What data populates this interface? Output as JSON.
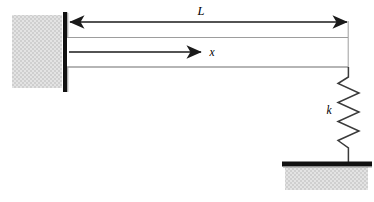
{
  "figure": {
    "type": "engineering-schematic",
    "background_color": "#ffffff",
    "line_color": "#1a1a1a",
    "beam_edge_color": "#999999",
    "hatch_fill_color": "#e0e0e0",
    "hatch_dot_color": "#c9c9c9",
    "support_color": "#111111"
  },
  "labels": {
    "length": "L",
    "axis": "x",
    "stiffness": "k"
  },
  "geometry": {
    "left_wall": {
      "x": 12,
      "y": 15,
      "width": 50,
      "height": 73
    },
    "fixed_support_bar": {
      "x": 63,
      "y": 12,
      "width": 4,
      "height": 80
    },
    "beam": {
      "x1": 67,
      "y1": 37,
      "x2": 348,
      "y2": 67
    },
    "dimension_line": {
      "x1": 69,
      "x2": 347,
      "y": 22
    },
    "axis_arrow": {
      "x1": 69,
      "x2": 202,
      "y": 52
    },
    "spring": {
      "x": 348,
      "y_top": 67,
      "y_bottom": 163,
      "coil_count": 6,
      "amplitude": 11
    },
    "ground_bar": {
      "x": 282,
      "y": 162,
      "width": 90,
      "height": 5
    },
    "ground_block": {
      "x": 285,
      "y": 167,
      "width": 83,
      "height": 23
    }
  },
  "annotations": {
    "length_label_pos": {
      "x": 201,
      "y": 15
    },
    "axis_label_pos": {
      "x": 212,
      "y": 56
    },
    "stiffness_label_pos": {
      "x": 329,
      "y": 114
    }
  }
}
